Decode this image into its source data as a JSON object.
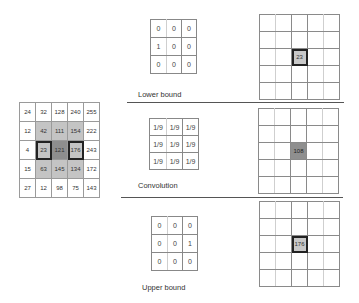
{
  "input_grid": {
    "rows": [
      [
        "24",
        "32",
        "128",
        "240",
        "255"
      ],
      [
        "12",
        "42",
        "111",
        "154",
        "222"
      ],
      [
        "4",
        "23",
        "121",
        "176",
        "243"
      ],
      [
        "15",
        "63",
        "145",
        "134",
        "172"
      ],
      [
        "27",
        "12",
        "98",
        "75",
        "143"
      ]
    ],
    "neighborhood_shade": "#c4c4c4",
    "center_shade": "#8e8e8e"
  },
  "panels": [
    {
      "label": "Lower bound",
      "kernel": [
        [
          "0",
          "0",
          "0"
        ],
        [
          "1",
          "0",
          "0"
        ],
        [
          "0",
          "0",
          "0"
        ]
      ],
      "result_value": "23",
      "result_style": "outlined"
    },
    {
      "label": "Convolution",
      "kernel": [
        [
          "1/9",
          "1/9",
          "1/9"
        ],
        [
          "1/9",
          "1/9",
          "1/9"
        ],
        [
          "1/9",
          "1/9",
          "1/9"
        ]
      ],
      "result_value": "108",
      "result_style": "filled"
    },
    {
      "label": "Upper bound",
      "kernel": [
        [
          "0",
          "0",
          "0"
        ],
        [
          "0",
          "0",
          "1"
        ],
        [
          "0",
          "0",
          "0"
        ]
      ],
      "result_value": "176",
      "result_style": "outlined"
    }
  ]
}
